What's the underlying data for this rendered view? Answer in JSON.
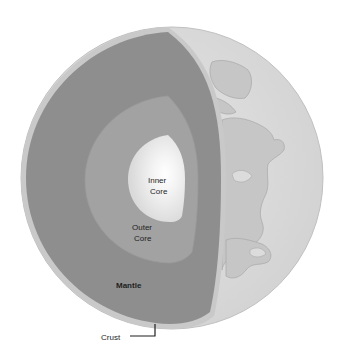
{
  "diagram": {
    "labels": {
      "inner_core_line1": "Inner",
      "inner_core_line2": "Core",
      "outer_core_line1": "Outer",
      "outer_core_line2": "Core",
      "mantle": "Mantle",
      "crust": "Crust"
    },
    "layers": [
      {
        "name": "Crust",
        "color": "#c9c9c9"
      },
      {
        "name": "Mantle",
        "color": "#8e8e8e"
      },
      {
        "name": "Outer Core",
        "color": "#a2a2a2"
      },
      {
        "name": "Inner Core",
        "color": "#e6e6e6"
      }
    ],
    "colors": {
      "globe_surface": "#dedede",
      "continents": "#c6c6c6",
      "coastline": "#a8a8a8",
      "leader_line": "#1e1e1e"
    }
  }
}
